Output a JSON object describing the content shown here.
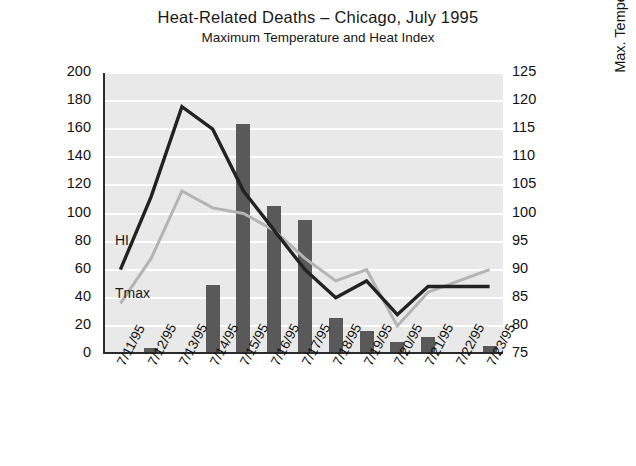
{
  "chart_data": {
    "type": "bar",
    "title": "Heat-Related Deaths – Chicago, July 1995",
    "subtitle": "Maximum Temperature and Heat Index",
    "xlabel": "",
    "ylabel": "Number of Heat-Related Deaths",
    "ylabel_right": "Max. Temperature (F) or Max. Heat Index",
    "categories": [
      "7/11/95",
      "7/12/95",
      "7/13/95",
      "7/14/95",
      "7/15/95",
      "7/16/95",
      "7/17/95",
      "7/18/95",
      "7/19/95",
      "7/20/95",
      "7/21/95",
      "7/22/95",
      "7/23/95"
    ],
    "values": [
      0,
      3,
      0,
      48,
      162,
      104,
      94,
      24,
      15,
      7,
      11,
      0,
      4
    ],
    "bar_series_name": "Number of Heat-Related Deaths",
    "ylim": [
      0,
      200
    ],
    "yticks": [
      0,
      20,
      40,
      60,
      80,
      100,
      120,
      140,
      160,
      180,
      200
    ],
    "ylim_right": [
      75,
      125
    ],
    "yticks_right": [
      75,
      80,
      85,
      90,
      95,
      100,
      105,
      110,
      115,
      120,
      125
    ],
    "grid": true,
    "legend": "inline-labels",
    "series": [
      {
        "name": "HI",
        "axis": "right",
        "color": "#222222",
        "values": [
          90,
          103,
          119,
          115,
          104,
          97,
          90,
          85,
          88,
          82,
          87,
          87,
          87
        ]
      },
      {
        "name": "Tmax",
        "axis": "right",
        "color": "#b4b4b4",
        "values": [
          84,
          92,
          104,
          101,
          100,
          97,
          92,
          88,
          90,
          80,
          86,
          88,
          90
        ]
      }
    ],
    "annotations": [
      {
        "text": "HI",
        "series": "HI"
      },
      {
        "text": "Tmax",
        "series": "Tmax"
      }
    ],
    "colors": {
      "bar": "#595959",
      "hi_line": "#222222",
      "tmax_line": "#b4b4b4",
      "plot_background": "#e9e9e9",
      "gridline": "#ffffff",
      "axis": "#2b2b2b"
    }
  }
}
